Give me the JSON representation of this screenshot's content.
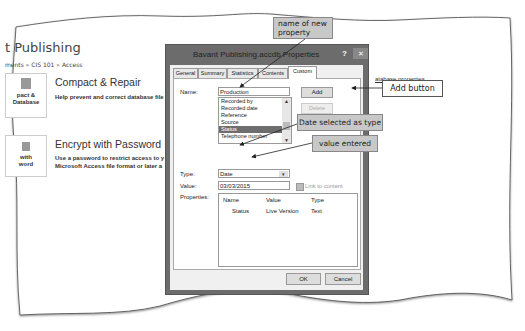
{
  "background": {
    "app_title": "t Publishing",
    "breadcrumb": "ments » CIS 101 » Access",
    "tiles": [
      {
        "label_line1": "pact &",
        "label_line2": "Database",
        "icon": "compact-repair-icon"
      },
      {
        "label_line1": "with",
        "label_line2": "word",
        "icon": "encrypt-icon"
      }
    ],
    "features": [
      {
        "title": "Compact & Repair",
        "description": "Help prevent and correct database file"
      },
      {
        "title": "Encrypt with Password",
        "description_line1": "Use a password to restrict access to y",
        "description_line2": "Microsoft Access file format or later a"
      }
    ],
    "right_link": "atabase properties"
  },
  "dialog": {
    "title": "Bavant Publishing.accdb Properties",
    "help_label": "?",
    "close_label": "✕",
    "tabs": [
      {
        "label": "General",
        "active": false
      },
      {
        "label": "Summary",
        "active": false
      },
      {
        "label": "Statistics",
        "active": false
      },
      {
        "label": "Contents",
        "active": false
      },
      {
        "label": "Custom",
        "active": true
      }
    ],
    "name_label": "Name:",
    "name_value": "Production",
    "name_list": [
      {
        "label": "Recorded by",
        "selected": false
      },
      {
        "label": "Recorded date",
        "selected": false
      },
      {
        "label": "Reference",
        "selected": false
      },
      {
        "label": "Source",
        "selected": false
      },
      {
        "label": "Status",
        "selected": true
      },
      {
        "label": "Telephone number",
        "selected": false
      }
    ],
    "add_button": "Add",
    "delete_button": "Delete",
    "type_label": "Type:",
    "type_value": "Date",
    "value_label": "Value:",
    "value_value": "03/03/2015",
    "link_to_content_label": "Link to content",
    "properties_label": "Properties:",
    "properties_columns": [
      "Name",
      "Value",
      "Type"
    ],
    "properties_rows": [
      {
        "name": "Status",
        "value": "Live Version",
        "type": "Text"
      }
    ],
    "ok_button": "OK",
    "cancel_button": "Cancel"
  },
  "callouts": {
    "name_of_new_property_line1": "name of new",
    "name_of_new_property_line2": "property",
    "add_button": "Add button",
    "date_selected": "Date selected as type",
    "value_entered": "value entered"
  },
  "colors": {
    "dialog_frame": "#6c6c6c",
    "callout_fill": "#c8c8c8",
    "selected_item": "#6e6e6e"
  }
}
